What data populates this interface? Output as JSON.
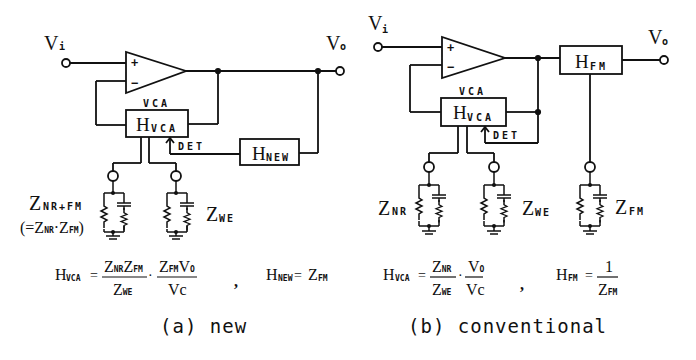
{
  "panel_a": {
    "caption": "(a) new",
    "vi": "V",
    "vi_sub": "i",
    "vo": "V",
    "vo_sub": "o",
    "vca_label": "VCA",
    "hvca_main": "H",
    "hvca_sub": "VCA",
    "det_label": "DET",
    "hnew_main": "H",
    "hnew_sub": "NEW",
    "opamp_plus": "+",
    "opamp_minus": "−",
    "z1_main": "Z",
    "z1_sub": "NR+FM",
    "z1_alt": "(=Z",
    "z1_alt_sub1": "NR",
    "z1_alt_mid": "·Z",
    "z1_alt_sub2": "FM",
    "z1_alt_end": ")",
    "z2_main": "Z",
    "z2_sub": "WE",
    "eq1_lhs": "H",
    "eq1_lhs_sub": "VCA",
    "eq1_eq": "=",
    "eq1_frac1_num": "Z",
    "eq1_frac1_num_sub1": "NR",
    "eq1_frac1_num_mid": "Z",
    "eq1_frac1_num_sub2": "FM",
    "eq1_frac1_den": "Z",
    "eq1_frac1_den_sub": "WE",
    "eq1_dot": "·",
    "eq1_frac2_num": "Z",
    "eq1_frac2_num_sub": "FM",
    "eq1_frac2_num_v": "V",
    "eq1_frac2_num_vsub": "O",
    "eq1_frac2_den": "Vc",
    "comma": ",",
    "eq2_lhs": "H",
    "eq2_lhs_sub": "NEW",
    "eq2_eq": "=",
    "eq2_rhs": "Z",
    "eq2_rhs_sub": "FM"
  },
  "panel_b": {
    "caption": "(b) conventional",
    "vi": "V",
    "vi_sub": "i",
    "vo": "V",
    "vo_sub": "o",
    "vca_label": "VCA",
    "hvca_main": "H",
    "hvca_sub": "VCA",
    "det_label": "DET",
    "hfm_main": "H",
    "hfm_sub": "FM",
    "opamp_plus": "+",
    "opamp_minus": "−",
    "z1_main": "Z",
    "z1_sub": "NR",
    "z2_main": "Z",
    "z2_sub": "WE",
    "z3_main": "Z",
    "z3_sub": "FM",
    "eq1_lhs": "H",
    "eq1_lhs_sub": "VCA",
    "eq1_eq": "=",
    "eq1_frac1_num": "Z",
    "eq1_frac1_num_sub": "NR",
    "eq1_frac1_den": "Z",
    "eq1_frac1_den_sub": "WE",
    "eq1_dot": "·",
    "eq1_frac2_num": "V",
    "eq1_frac2_num_sub": "O",
    "eq1_frac2_den": "Vc",
    "comma": ",",
    "eq2_lhs": "H",
    "eq2_lhs_sub": "FM",
    "eq2_eq": "=",
    "eq2_num": "1",
    "eq2_den": "Z",
    "eq2_den_sub": "FM"
  }
}
